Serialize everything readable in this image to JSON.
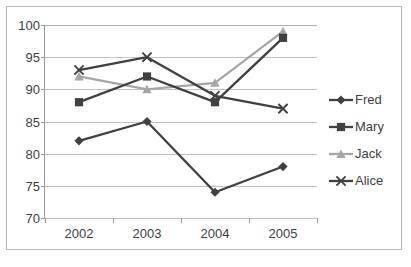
{
  "chart_data": {
    "type": "line",
    "title": "",
    "xlabel": "",
    "ylabel": "",
    "categories": [
      "2002",
      "2003",
      "2004",
      "2005"
    ],
    "ylim": [
      70,
      100
    ],
    "yticks": [
      70,
      75,
      80,
      85,
      90,
      95,
      100
    ],
    "grid": true,
    "legend_position": "right",
    "series": [
      {
        "name": "Fred",
        "marker": "diamond",
        "color": "#404040",
        "values": [
          82,
          85,
          74,
          78
        ]
      },
      {
        "name": "Mary",
        "marker": "square",
        "color": "#404040",
        "values": [
          88,
          92,
          88,
          98
        ]
      },
      {
        "name": "Jack",
        "marker": "triangle",
        "color": "#a6a6a6",
        "values": [
          92,
          90,
          91,
          99
        ]
      },
      {
        "name": "Alice",
        "marker": "cross",
        "color": "#404040",
        "values": [
          93,
          95,
          89,
          87
        ]
      }
    ]
  },
  "axis": {
    "y_labels": [
      "100",
      "95",
      "90",
      "85",
      "80",
      "75",
      "70"
    ],
    "x_labels": [
      "2002",
      "2003",
      "2004",
      "2005"
    ]
  },
  "legend": {
    "items": [
      {
        "label": "Fred"
      },
      {
        "label": "Mary"
      },
      {
        "label": "Jack"
      },
      {
        "label": "Alice"
      }
    ]
  },
  "colors": {
    "dark_series": "#404040",
    "light_series": "#a6a6a6",
    "gridline": "#c3c3c3",
    "axis": "#9b9b9b",
    "frame": "#b6b6b6",
    "text": "#3f3f3f"
  }
}
